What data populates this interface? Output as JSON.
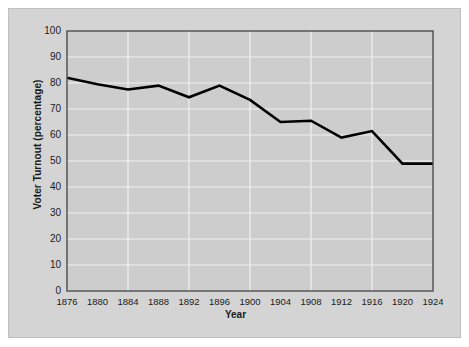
{
  "chart_data": {
    "type": "line",
    "title": "",
    "subtitle": "",
    "xlabel": "Year",
    "ylabel": "Voter Turnout (percentage)",
    "x": [
      1876,
      1880,
      1884,
      1888,
      1892,
      1896,
      1900,
      1904,
      1908,
      1912,
      1916,
      1920,
      1924
    ],
    "values": [
      82,
      79.5,
      77.5,
      79,
      74.5,
      79,
      73.5,
      65,
      65.5,
      59,
      61.5,
      49,
      49
    ],
    "xtick_labels": [
      "1876",
      "1880",
      "1884",
      "1888",
      "1892",
      "1896",
      "1900",
      "1904",
      "1908",
      "1912",
      "1916",
      "1920",
      "1924"
    ],
    "ytick_labels": [
      "100",
      "90",
      "80",
      "70",
      "60",
      "50",
      "40",
      "30",
      "20",
      "10",
      "0"
    ],
    "ytick_values": [
      100,
      90,
      80,
      70,
      60,
      50,
      40,
      30,
      20,
      10,
      0
    ],
    "xlim": [
      1876,
      1924
    ],
    "ylim": [
      0,
      100
    ],
    "grid": true,
    "legend": false,
    "legend_position": "none",
    "series": [
      {
        "name": "Voter Turnout",
        "values": [
          82,
          79.5,
          77.5,
          79,
          74.5,
          79,
          73.5,
          65,
          65.5,
          59,
          61.5,
          49,
          49
        ]
      }
    ],
    "colors": {
      "line": "#000000",
      "plot_background": "#cdcdcd",
      "figure_background": "#d4d4d4",
      "gridline": "#f2f2f2",
      "axis": "#4d4d4d",
      "text": "#1a1a1a"
    }
  }
}
